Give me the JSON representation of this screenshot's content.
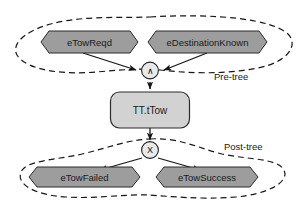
{
  "diagram": {
    "background_color": "#ffffff",
    "colors": {
      "event_fill": "#9d9d9d",
      "process_fill": "#d2d2d2",
      "gate_fill": "#e9e9e9",
      "stroke": "#1f1f1f",
      "text": "#1a1a1a"
    },
    "regions": [
      {
        "id": "pre-tree",
        "label": "Pre-tree",
        "style": "dashed-ellipse"
      },
      {
        "id": "post-tree",
        "label": "Post-tree",
        "style": "dashed-blob"
      }
    ],
    "nodes": {
      "pre_events": [
        {
          "id": "eTowReqd",
          "label": "eTowReqd",
          "shape": "hexagon"
        },
        {
          "id": "eDestinationKnown",
          "label": "eDestinationKnown",
          "shape": "hexagon"
        }
      ],
      "process": {
        "id": "TT.tTow",
        "label": "TT.tTow",
        "shape": "rounded-rect"
      },
      "post_events": [
        {
          "id": "eTowFailed",
          "label": "eTowFailed",
          "shape": "hexagon"
        },
        {
          "id": "eTowSuccess",
          "label": "eTowSuccess",
          "shape": "hexagon"
        }
      ]
    },
    "gates": [
      {
        "id": "and-gate",
        "symbol": "∧",
        "type": "AND",
        "shape": "circle"
      },
      {
        "id": "xor-gate",
        "symbol": "X",
        "type": "XOR",
        "shape": "circle"
      }
    ],
    "edges": [
      {
        "from": "eTowReqd",
        "to": "and-gate"
      },
      {
        "from": "eDestinationKnown",
        "to": "and-gate"
      },
      {
        "from": "and-gate",
        "to": "TT.tTow"
      },
      {
        "from": "TT.tTow",
        "to": "xor-gate"
      },
      {
        "from": "xor-gate",
        "to": "eTowFailed"
      },
      {
        "from": "xor-gate",
        "to": "eTowSuccess"
      }
    ]
  }
}
